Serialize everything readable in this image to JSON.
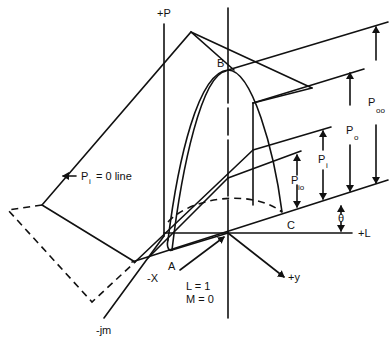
{
  "diagram": {
    "type": "3D geometric construction",
    "axes": {
      "p_axis": "+P",
      "l_axis": "+L",
      "x_axis": "-X",
      "y_axis": "+y",
      "jm_axis": "-jm"
    },
    "points": {
      "a": "A",
      "b": "B",
      "c": "C"
    },
    "origin_label": {
      "line1": "L = 1",
      "line2": "M = 0"
    },
    "pi_zero_line": {
      "p": "P",
      "sub": "i",
      "rest": "= 0 line"
    },
    "dimensions": [
      {
        "main": "P",
        "sub": "oo"
      },
      {
        "main": "P",
        "sub": "o"
      },
      {
        "main": "P",
        "sub": "i"
      },
      {
        "main": "P",
        "sub": "io"
      }
    ],
    "angle": "θ"
  }
}
